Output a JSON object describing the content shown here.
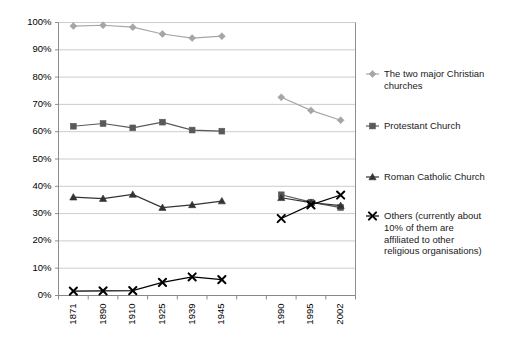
{
  "chart_data": {
    "type": "line",
    "title": "",
    "subtitle": "",
    "xlabel": "",
    "ylabel": "",
    "ylim": [
      0,
      100
    ],
    "ytick_labels": [
      "0%",
      "10%",
      "20%",
      "30%",
      "40%",
      "50%",
      "60%",
      "70%",
      "80%",
      "90%",
      "100%"
    ],
    "ytick_values": [
      0,
      10,
      20,
      30,
      40,
      50,
      60,
      70,
      80,
      90,
      100
    ],
    "grid": true,
    "legend_position": "right",
    "categories": [
      "1871",
      "1890",
      "1910",
      "1925",
      "1939",
      "1945",
      "",
      "1990",
      "1995",
      "2002"
    ],
    "slot_count": 10,
    "empty_slot_index": 6,
    "series": [
      {
        "name": "The two major Christian churches",
        "marker": "diamond",
        "color": "#a6a6a6",
        "values": [
          98.7,
          99.0,
          98.3,
          95.8,
          94.3,
          95.0,
          null,
          72.6,
          67.8,
          64.2
        ]
      },
      {
        "name": "Protestant Church",
        "marker": "square",
        "color": "#595959",
        "values": [
          62.0,
          63.0,
          61.4,
          63.5,
          60.6,
          60.2,
          null,
          36.9,
          34.2,
          32.2
        ]
      },
      {
        "name": "Roman Catholic Church",
        "marker": "triangle",
        "color": "#333333",
        "values": [
          36.0,
          35.5,
          37.0,
          32.2,
          33.2,
          34.6,
          null,
          35.8,
          34.0,
          32.9
        ]
      },
      {
        "name": "Others (currently about 10% of them are affiliated to other religious organisations)",
        "marker": "cross",
        "color": "#000000",
        "values": [
          1.6,
          1.7,
          1.8,
          4.8,
          6.8,
          5.8,
          null,
          28.2,
          33.2,
          36.8
        ]
      }
    ]
  },
  "legend": {
    "items": [
      {
        "lines": [
          "The two major Christian",
          "churches"
        ],
        "marker": "diamond",
        "color": "#a6a6a6"
      },
      {
        "lines": [
          "Protestant Church"
        ],
        "marker": "square",
        "color": "#595959"
      },
      {
        "lines": [
          "Roman Catholic Church"
        ],
        "marker": "triangle",
        "color": "#333333"
      },
      {
        "lines": [
          "Others (currently about",
          "10% of them are",
          "affiliated to other",
          "religious organisations)"
        ],
        "marker": "cross",
        "color": "#000000"
      }
    ]
  },
  "colors": {
    "grid": "#bfbfbf",
    "axis": "#808080",
    "background": "#ffffff",
    "text": "#000000"
  }
}
